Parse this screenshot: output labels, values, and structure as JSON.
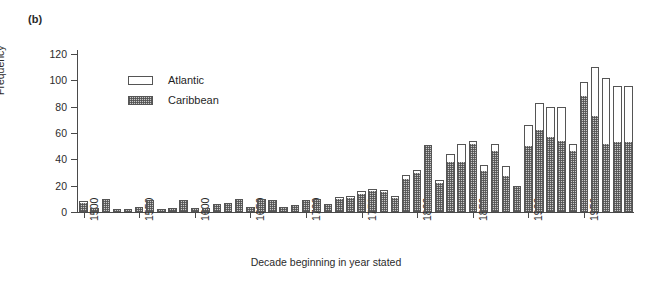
{
  "figure": {
    "panel_label": "(b)"
  },
  "legend": {
    "position": "inside-top-left",
    "entries": [
      {
        "label": "Atlantic",
        "swatch": "white-open-box"
      },
      {
        "label": "Caribbean",
        "swatch": "stippled-box"
      }
    ]
  },
  "chart_data": {
    "type": "bar",
    "title": "",
    "subtitle": "",
    "xlabel": "Decade beginning in year stated",
    "ylabel": "Frequency",
    "ylim": [
      0,
      120
    ],
    "yticks": [
      0,
      20,
      40,
      60,
      80,
      100,
      120
    ],
    "xticks": [
      1500,
      1550,
      1600,
      1650,
      1700,
      1750,
      1800,
      1850,
      1900,
      1950
    ],
    "grid": false,
    "stacked": true,
    "categories": [
      1500,
      1510,
      1520,
      1530,
      1540,
      1550,
      1560,
      1570,
      1580,
      1590,
      1600,
      1610,
      1620,
      1630,
      1640,
      1650,
      1660,
      1670,
      1680,
      1690,
      1700,
      1710,
      1720,
      1730,
      1740,
      1750,
      1760,
      1770,
      1780,
      1790,
      1800,
      1810,
      1820,
      1830,
      1840,
      1850,
      1860,
      1870,
      1880,
      1890,
      1900,
      1910,
      1920,
      1930,
      1940,
      1950,
      1960,
      1970,
      1980,
      1990
    ],
    "series": [
      {
        "name": "Caribbean",
        "values": [
          7,
          3,
          9,
          2,
          2,
          4,
          8,
          2,
          3,
          8,
          3,
          3,
          6,
          7,
          9,
          4,
          9,
          8,
          4,
          5,
          8,
          9,
          6,
          10,
          11,
          14,
          16,
          15,
          11,
          25,
          30,
          50,
          22,
          38,
          38,
          52,
          31,
          46,
          27,
          20,
          50,
          62,
          57,
          54,
          46,
          88,
          73,
          52,
          53,
          53
        ]
      },
      {
        "name": "Atlantic",
        "values": [
          1,
          0,
          1,
          0,
          0,
          0,
          1,
          0,
          0,
          1,
          0,
          0,
          0,
          0,
          1,
          0,
          1,
          1,
          0,
          0,
          1,
          1,
          0,
          1,
          1,
          2,
          1,
          2,
          1,
          3,
          2,
          1,
          2,
          6,
          14,
          2,
          5,
          6,
          8,
          0,
          16,
          21,
          23,
          26,
          6,
          11,
          37,
          50,
          43,
          43
        ]
      }
    ],
    "totals": [
      8,
      3,
      10,
      2,
      2,
      4,
      9,
      2,
      3,
      9,
      3,
      3,
      6,
      7,
      10,
      4,
      10,
      9,
      4,
      5,
      9,
      10,
      6,
      11,
      12,
      16,
      17,
      17,
      12,
      28,
      32,
      51,
      24,
      44,
      52,
      54,
      36,
      52,
      35,
      20,
      66,
      83,
      80,
      80,
      52,
      99,
      110,
      102,
      96,
      96
    ]
  }
}
